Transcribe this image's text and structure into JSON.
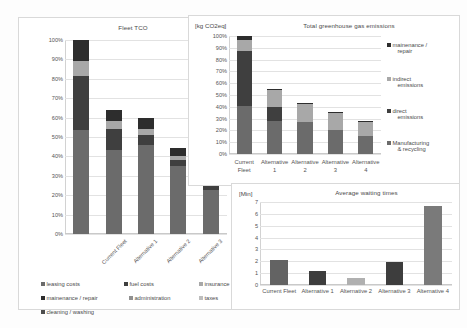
{
  "chart_data": [
    {
      "id": "fleet-tco",
      "type": "bar",
      "stacked": true,
      "title": "Fleet TCO",
      "xlabel": "",
      "ylabel": "",
      "ylim": [
        0,
        100
      ],
      "ytick_labels": [
        "100%",
        "90%",
        "80%",
        "70%",
        "60%",
        "50%",
        "40%",
        "30%",
        "20%",
        "10%",
        "0%"
      ],
      "grid": true,
      "legend_position": "bottom",
      "categories": [
        "Current Fleet",
        "Alternative 1",
        "Alternative 2",
        "Alternative 3",
        "Alternative 4"
      ],
      "series": [
        {
          "name": "leasing costs",
          "color": "#6b6b6b",
          "values": [
            53.5,
            54.0,
            59.5,
            52.5,
            40.0
          ]
        },
        {
          "name": "mainenance / repair",
          "color": "#3f3f3f",
          "values": [
            28.0,
            13.5,
            6.5,
            4.5,
            6.0
          ]
        },
        {
          "name": "insurance",
          "color": "#a8a8a8",
          "values": [
            7.5,
            5.5,
            4.0,
            3.5,
            3.5
          ]
        },
        {
          "name": "cleaning / washing",
          "color": "#2d2d2d",
          "values": [
            11.0,
            7.0,
            7.5,
            6.0,
            7.0
          ]
        }
      ],
      "legend_entries": [
        {
          "label": "leasing costs",
          "color": "#6b6b6b"
        },
        {
          "label": "fuel costs",
          "color": "#3f3f3f"
        },
        {
          "label": "insurance",
          "color": "#a8a8a8"
        },
        {
          "label": "mainenance / repair",
          "color": "#2d2d2d"
        },
        {
          "label": "administration",
          "color": "#909090"
        },
        {
          "label": "taxes",
          "color": "#bdbdbd"
        },
        {
          "label": "cleaning / washing",
          "color": "#4d4d4d"
        }
      ]
    },
    {
      "id": "ghg-emissions",
      "type": "bar",
      "stacked": true,
      "title": "Total greenhouse gas emissions",
      "unit": "[kg CO2eq]",
      "xlabel": "",
      "ylabel": "",
      "ylim": [
        0,
        100
      ],
      "ytick_labels": [
        "100%",
        "90%",
        "80%",
        "70%",
        "60%",
        "50%",
        "40%",
        "30%",
        "20%",
        "10%",
        "0%"
      ],
      "grid": true,
      "legend_position": "right",
      "categories": [
        "Current Fleet",
        "Alternative 1",
        "Alternative 2",
        "Alternative 3",
        "Alternative 4"
      ],
      "category_lines": [
        [
          "Current",
          "Fleet"
        ],
        [
          "Alternative",
          "1"
        ],
        [
          "Alternative",
          "2"
        ],
        [
          "Alternative",
          "3"
        ],
        [
          "Alternative",
          "4"
        ]
      ],
      "series": [
        {
          "name": "Manufacturing & recycling",
          "color": "#6b6b6b",
          "values": [
            41.0,
            38.0,
            41.5,
            34.5,
            28.5
          ]
        },
        {
          "name": "direct emissions",
          "color": "#3f3f3f",
          "values": [
            46.5,
            15.5,
            0.0,
            0.0,
            0.0
          ]
        },
        {
          "name": "indirect emissions",
          "color": "#a8a8a8",
          "values": [
            9.5,
            20.0,
            23.5,
            24.5,
            24.0
          ]
        },
        {
          "name": "mainenance / repair",
          "color": "#2d2d2d",
          "values": [
            3.0,
            0.5,
            0.5,
            0.5,
            0.5
          ]
        }
      ],
      "legend_entries": [
        {
          "label": "mainenance /",
          "label2": "repair",
          "color": "#2d2d2d"
        },
        {
          "label": "indirect",
          "label2": "emissions",
          "color": "#a8a8a8"
        },
        {
          "label": "direct",
          "label2": "emissions",
          "color": "#3f3f3f"
        },
        {
          "label": "Manufacturing",
          "label2": "& recycling",
          "color": "#6b6b6b"
        }
      ]
    },
    {
      "id": "average-waiting-times",
      "type": "bar",
      "stacked": false,
      "title": "Average waiting times",
      "unit": "[Min]",
      "xlabel": "",
      "ylabel": "",
      "ylim": [
        0,
        7
      ],
      "ytick_labels": [
        "7",
        "6",
        "5",
        "4",
        "3",
        "2",
        "1",
        "0"
      ],
      "grid": true,
      "legend_position": "none",
      "categories": [
        "Current Fleet",
        "Alternative 1",
        "Alternative 2",
        "Alternative 3",
        "Alternative 4"
      ],
      "values": [
        2.15,
        1.15,
        0.6,
        1.95,
        6.65
      ],
      "colors": [
        "#636363",
        "#3d3d3d",
        "#b0b0b0",
        "#3d3d3d",
        "#7a7a7a"
      ]
    }
  ]
}
